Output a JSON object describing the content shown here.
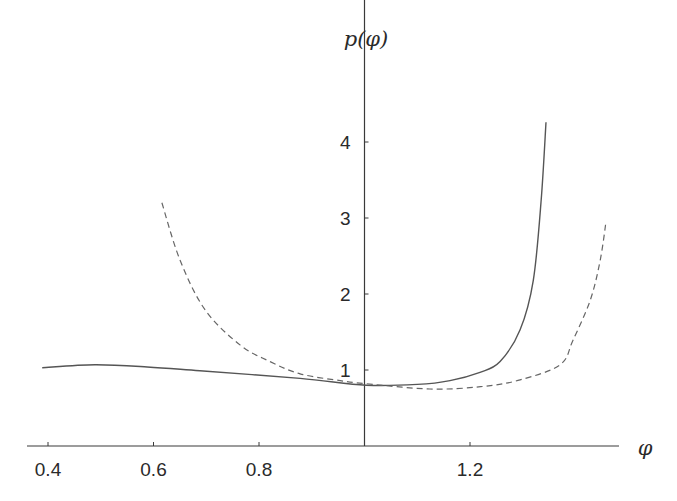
{
  "chart_data": {
    "type": "line",
    "title": "",
    "xlabel": "φ",
    "ylabel": "p(φ)",
    "xlim": [
      0.39,
      1.47
    ],
    "ylim": [
      0,
      4.9
    ],
    "grid": false,
    "legend": null,
    "x_ticks": [
      {
        "value": 0.4,
        "label": "0.4"
      },
      {
        "value": 0.6,
        "label": "0.6"
      },
      {
        "value": 0.8,
        "label": "0.8"
      },
      {
        "value": 1.0,
        "label": ""
      },
      {
        "value": 1.2,
        "label": "1.2"
      }
    ],
    "y_ticks": [
      {
        "value": 1,
        "label": "1"
      },
      {
        "value": 2,
        "label": "2"
      },
      {
        "value": 3,
        "label": "3"
      },
      {
        "value": 4,
        "label": "4"
      }
    ],
    "y_axis_at_x": 1.0,
    "series": [
      {
        "name": "solid",
        "style": "solid",
        "color": "#555555",
        "x": [
          0.389,
          0.489,
          0.588,
          0.688,
          0.878,
          1.003,
          1.1,
          1.162,
          1.219,
          1.257,
          1.295,
          1.32,
          1.335,
          1.344
        ],
        "y": [
          1.03,
          1.07,
          1.04,
          0.99,
          0.89,
          0.8,
          0.81,
          0.86,
          0.97,
          1.11,
          1.53,
          2.18,
          3.24,
          4.26
        ]
      },
      {
        "name": "dashed",
        "style": "dashed",
        "color": "#666666",
        "x": [
          0.616,
          0.65,
          0.698,
          0.764,
          0.821,
          0.878,
          0.954,
          1.003,
          1.124,
          1.22,
          1.295,
          1.371,
          1.395,
          1.428,
          1.447,
          1.458
        ],
        "y": [
          3.2,
          2.45,
          1.79,
          1.33,
          1.11,
          0.95,
          0.86,
          0.82,
          0.75,
          0.78,
          0.87,
          1.07,
          1.39,
          1.92,
          2.45,
          2.96
        ]
      }
    ]
  },
  "layout": {
    "x_px": {
      "origin_value": 0.4,
      "origin_px": 48,
      "px_per_unit": 527.5
    },
    "y_px": {
      "zero_px": 446,
      "px_per_unit": 76
    },
    "x_axis": {
      "from_px": 27,
      "to_px": 619
    },
    "y_axis": {
      "top_px": 66
    }
  }
}
